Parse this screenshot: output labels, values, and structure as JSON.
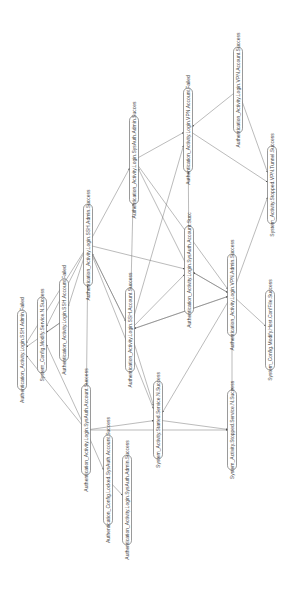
{
  "diagram": {
    "type": "directed-graph",
    "orientation": "rotated-90-ccw",
    "colors": {
      "edge": "#666666",
      "node_border": "#555555",
      "text": "#444444",
      "background": "#ffffff"
    },
    "nodes": [
      {
        "id": "n1",
        "label": "Authentication_Activity.Login.SSH.Admin.Failed",
        "x": 22,
        "y": 350,
        "w": 80
      },
      {
        "id": "n2",
        "label": "System_Config.Modify.Service.N.Success",
        "x": 42,
        "y": 335,
        "w": 76
      },
      {
        "id": "n3",
        "label": "Authentication_Activity.Login.SSH.Account.Failed",
        "x": 64,
        "y": 320,
        "w": 82
      },
      {
        "id": "n4",
        "label": "Authentication_Activity.Login.SSH.Admin.Success",
        "x": 88,
        "y": 245,
        "w": 82
      },
      {
        "id": "n5",
        "label": "Authentication_Activity.Login.SysAuth.Account.Success",
        "x": 86,
        "y": 430,
        "w": 90
      },
      {
        "id": "n6",
        "label": "Authentication_Config.Locked.SysAuth.Account.Success",
        "x": 108,
        "y": 480,
        "w": 90
      },
      {
        "id": "n7",
        "label": "Authentication_Activity.Login.SysAuth.Admin.Success",
        "x": 127,
        "y": 500,
        "w": 90
      },
      {
        "id": "n8",
        "label": "Authentication_Activity.Login.SSH.Account.Success",
        "x": 130,
        "y": 330,
        "w": 84
      },
      {
        "id": "n9",
        "label": "System_Activity.Started.Service.N.Success",
        "x": 158,
        "y": 420,
        "w": 78
      },
      {
        "id": "n10",
        "label": "Authentication_Activity.Login.SysAuth.Admin.Succes",
        "x": 134,
        "y": 160,
        "w": 88
      },
      {
        "id": "n11",
        "label": "Authentication_Activity.Login.SysAuth.Account.Succ",
        "x": 189,
        "y": 270,
        "w": 88
      },
      {
        "id": "n12",
        "label": "Authentication_Activity.Login.VPN.Account.Failed",
        "x": 188,
        "y": 130,
        "w": 84
      },
      {
        "id": "n13",
        "label": "Authentication_Activity.Login.VPN.Admin.Success",
        "x": 232,
        "y": 295,
        "w": 82
      },
      {
        "id": "n14",
        "label": "System_Activity.Stopped.Service.N.Success",
        "x": 232,
        "y": 430,
        "w": 80
      },
      {
        "id": "n15",
        "label": "Authentication_Activity.Login.VPN.Account.Success",
        "x": 238,
        "y": 90,
        "w": 86
      },
      {
        "id": "n16",
        "label": "System_Config.Modify.Host.ConfFile.Success",
        "x": 270,
        "y": 330,
        "w": 80
      },
      {
        "id": "n17",
        "label": "System_Activity.Stopped.VPN.Tunnel.Success",
        "x": 272,
        "y": 185,
        "w": 78
      }
    ],
    "edges": [
      [
        "n3",
        "n1"
      ],
      [
        "n3",
        "n2"
      ],
      [
        "n4",
        "n1"
      ],
      [
        "n4",
        "n2"
      ],
      [
        "n4",
        "n3"
      ],
      [
        "n4",
        "n10"
      ],
      [
        "n4",
        "n11"
      ],
      [
        "n4",
        "n8"
      ],
      [
        "n4",
        "n9"
      ],
      [
        "n5",
        "n2"
      ],
      [
        "n5",
        "n1"
      ],
      [
        "n5",
        "n4"
      ],
      [
        "n5",
        "n6"
      ],
      [
        "n5",
        "n9"
      ],
      [
        "n5",
        "n14"
      ],
      [
        "n6",
        "n7"
      ],
      [
        "n8",
        "n4"
      ],
      [
        "n8",
        "n9"
      ],
      [
        "n8",
        "n11"
      ],
      [
        "n8",
        "n13"
      ],
      [
        "n8",
        "n12"
      ],
      [
        "n8",
        "n10"
      ],
      [
        "n10",
        "n12"
      ],
      [
        "n10",
        "n13"
      ],
      [
        "n11",
        "n13"
      ],
      [
        "n11",
        "n12"
      ],
      [
        "n13",
        "n11"
      ],
      [
        "n13",
        "n14"
      ],
      [
        "n13",
        "n16"
      ],
      [
        "n13",
        "n8"
      ],
      [
        "n13",
        "n9"
      ],
      [
        "n13",
        "n17"
      ],
      [
        "n15",
        "n12"
      ],
      [
        "n15",
        "n17"
      ],
      [
        "n12",
        "n17"
      ],
      [
        "n11",
        "n10"
      ],
      [
        "n9",
        "n14"
      ]
    ]
  }
}
